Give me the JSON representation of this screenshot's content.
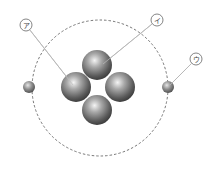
{
  "diagram": {
    "type": "atom-model",
    "labels": [
      {
        "id": "a",
        "text": "ア",
        "cx": 26,
        "cy": 25,
        "target": [
          73,
          85
        ]
      },
      {
        "id": "i",
        "text": "イ",
        "cx": 157,
        "cy": 20,
        "target": [
          103,
          64
        ]
      },
      {
        "id": "u",
        "text": "ウ",
        "cx": 196,
        "cy": 59,
        "target": [
          170,
          85
        ]
      }
    ],
    "orbit": {
      "cx": 100,
      "cy": 88,
      "r": 68
    },
    "nucleus": [
      {
        "cx": 97,
        "cy": 65,
        "r": 15
      },
      {
        "cx": 76,
        "cy": 87,
        "r": 15
      },
      {
        "cx": 120,
        "cy": 87,
        "r": 15
      },
      {
        "cx": 97,
        "cy": 110,
        "r": 15
      }
    ],
    "electrons": [
      {
        "cx": 29,
        "cy": 87,
        "r": 6
      },
      {
        "cx": 168,
        "cy": 87,
        "r": 6
      }
    ]
  }
}
